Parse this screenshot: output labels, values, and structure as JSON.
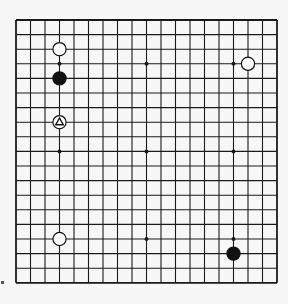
{
  "board": {
    "size": 19,
    "origin_x": 16,
    "origin_y": 20,
    "step_x": 14.5,
    "step_y": 14.6,
    "line_color": "#1a1a1a",
    "background": "#f7f7f7",
    "star_points": [
      [
        3,
        3
      ],
      [
        9,
        3
      ],
      [
        15,
        3
      ],
      [
        3,
        9
      ],
      [
        9,
        9
      ],
      [
        15,
        9
      ],
      [
        3,
        15
      ],
      [
        9,
        15
      ],
      [
        15,
        15
      ]
    ],
    "stones": [
      {
        "color": "white",
        "col": 3,
        "row": 2
      },
      {
        "color": "black",
        "col": 3,
        "row": 4
      },
      {
        "color": "white",
        "col": 3,
        "row": 7,
        "marker": "triangle"
      },
      {
        "color": "white",
        "col": 3,
        "row": 15
      },
      {
        "color": "white",
        "col": 16,
        "row": 3
      },
      {
        "color": "black",
        "col": 15,
        "row": 16
      }
    ]
  }
}
